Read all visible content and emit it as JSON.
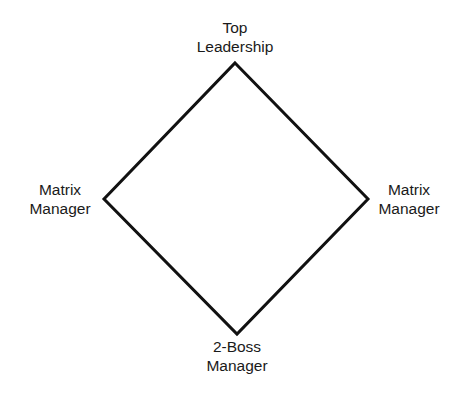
{
  "diagram": {
    "type": "diamond",
    "stroke_color": "#111111",
    "background": "#ffffff",
    "nodes": {
      "top": {
        "line1": "Top",
        "line2": "Leadership"
      },
      "left": {
        "line1": "Matrix",
        "line2": "Manager"
      },
      "right": {
        "line1": "Matrix",
        "line2": "Manager"
      },
      "bottom": {
        "line1": "2-Boss",
        "line2": "Manager"
      }
    },
    "edges": [
      {
        "from": "top",
        "to": "right"
      },
      {
        "from": "right",
        "to": "bottom"
      },
      {
        "from": "bottom",
        "to": "left"
      },
      {
        "from": "left",
        "to": "top"
      }
    ]
  }
}
